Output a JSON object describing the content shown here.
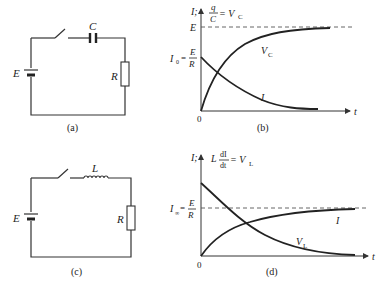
{
  "figure": {
    "panels": [
      {
        "id": "a",
        "caption": "(a)",
        "type": "circuit",
        "components": {
          "source_label": "E",
          "capacitor_label": "C",
          "resistor_label": "R"
        }
      },
      {
        "id": "b",
        "caption": "(b)",
        "type": "graph",
        "y_axis_label_main": "I;",
        "y_axis_label_frac_num": "q",
        "y_axis_label_frac_den": "C",
        "y_axis_label_rest": "= V",
        "y_axis_label_sub": "C",
        "asymptote_label": "E",
        "initial_label_prefix": "I",
        "initial_label_sub": "0",
        "initial_label_eq": "=",
        "initial_label_frac_num": "E",
        "initial_label_frac_den": "R",
        "x_axis_label": "t",
        "origin_label": "0",
        "curve_labels": {
          "rising_main": "V",
          "rising_sub": "C",
          "decaying": "I"
        }
      },
      {
        "id": "c",
        "caption": "(c)",
        "type": "circuit",
        "components": {
          "source_label": "E",
          "inductor_label": "L",
          "resistor_label": "R"
        }
      },
      {
        "id": "d",
        "caption": "(d)",
        "type": "graph",
        "y_axis_label_main": "I;",
        "y_axis_label_L": "L",
        "y_axis_label_frac_num": "dI",
        "y_axis_label_frac_den": "dt",
        "y_axis_label_rest": "= V",
        "y_axis_label_sub": "L",
        "asymptote_label_prefix": "I",
        "asymptote_label_sub": "∞",
        "asymptote_label_eq": "=",
        "asymptote_label_frac_num": "E",
        "asymptote_label_frac_den": "R",
        "x_axis_label": "t",
        "origin_label": "0",
        "curve_labels": {
          "rising": "I",
          "decaying_main": "V",
          "decaying_sub": "L"
        }
      }
    ]
  }
}
